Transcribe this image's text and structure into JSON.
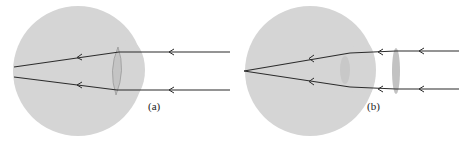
{
  "figure": {
    "panels": [
      {
        "id": "a",
        "label": "(a)"
      },
      {
        "id": "b",
        "label": "(b)"
      }
    ],
    "colors": {
      "eyeball": "#d4d4d4",
      "lens": "#c6c6c6",
      "ray": "#2b2b2b",
      "corrective_lens": "#c4c4c4"
    }
  }
}
